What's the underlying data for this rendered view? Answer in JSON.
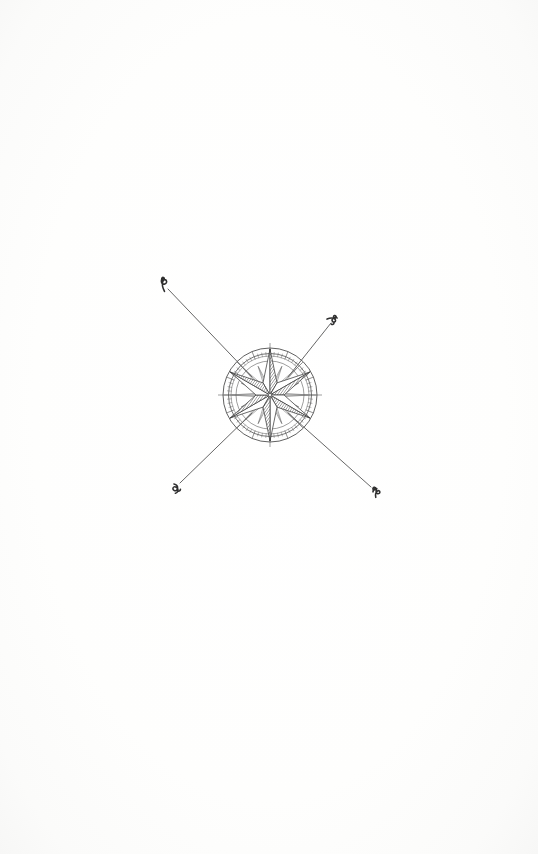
{
  "page": {
    "title": "Compass Rose Plate",
    "kind": "scanned-book-plate",
    "width": 538,
    "height": 854,
    "background_color": "#fdfdfc",
    "ink_color": "#3a3a3a",
    "shade_color": "#8d8d8d",
    "light_ink_color": "#6f6f6f"
  },
  "figure": {
    "name": "compass-rose",
    "center_x": 270,
    "center_y": 395,
    "outer_circle_radius": 47,
    "mid_circle_radius": 41,
    "inner_circle_radius": 34,
    "hub_radius": 3.2,
    "star_points": 6,
    "rose_points": 16,
    "rumb_line_count": 4,
    "cross_hair_extent": 52
  },
  "rumb_lines": [
    {
      "id": "rumb-northwest",
      "direction": "northwest",
      "x1": 245,
      "y1": 370,
      "x2": 167,
      "y2": 288,
      "glyph": "ornamental-letter-northwest",
      "glyph_x": 164,
      "glyph_y": 284,
      "glyph_rotation": -45,
      "label": "N"
    },
    {
      "id": "rumb-northeast",
      "direction": "northeast",
      "x1": 295,
      "y1": 370,
      "x2": 331,
      "y2": 322,
      "glyph": "ornamental-letter-northeast",
      "glyph_x": 333,
      "glyph_y": 318,
      "glyph_rotation": 45,
      "label": "E"
    },
    {
      "id": "rumb-southwest",
      "direction": "southwest",
      "x1": 245,
      "y1": 420,
      "x2": 179,
      "y2": 484,
      "glyph": "ornamental-letter-southwest",
      "glyph_x": 176,
      "glyph_y": 488,
      "glyph_rotation": 45,
      "label": "W"
    },
    {
      "id": "rumb-southeast",
      "direction": "southeast",
      "x1": 295,
      "y1": 420,
      "x2": 372,
      "y2": 488,
      "glyph": "ornamental-letter-southeast",
      "glyph_x": 375,
      "glyph_y": 492,
      "glyph_rotation": -45,
      "label": "S"
    }
  ],
  "star": {
    "shaded_sectors": [
      1,
      3,
      5,
      7,
      9,
      11
    ],
    "light_sectors": [
      0,
      2,
      4,
      6,
      8,
      10
    ],
    "point_radius": 46,
    "valley_radius": 14,
    "start_angle_deg": -90
  }
}
